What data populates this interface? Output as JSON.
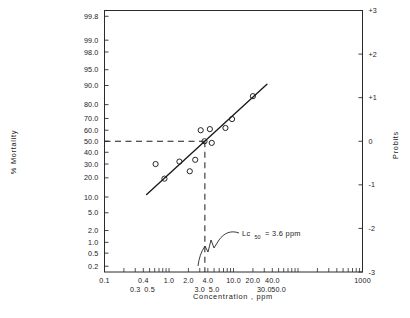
{
  "chart_data": {
    "type": "scatter",
    "title": "",
    "subtitle": "",
    "xlabel": "Concentration ,   ppm",
    "ylabel": "% Mortality",
    "y2label": "Probits",
    "x_scale": "log10",
    "y_scale": "probit",
    "xlim": [
      0.1,
      1000
    ],
    "ylim_percent": [
      0.13,
      99.87
    ],
    "ylim_probit": [
      -3,
      3
    ],
    "grid": false,
    "legend": null,
    "x_tick_labels": [
      "0.1",
      "0.3",
      "0.4",
      "0.5",
      "1.0",
      "2.0",
      "3.0",
      "4.0",
      "5.0",
      "10.0",
      "20.0",
      "30.0",
      "40.0",
      "50.0",
      "1000"
    ],
    "x_tick_values": [
      0.1,
      0.3,
      0.4,
      0.5,
      1.0,
      2.0,
      3.0,
      4.0,
      5.0,
      10.0,
      20.0,
      30.0,
      40.0,
      50.0,
      1000
    ],
    "x_tick_rows": [
      0,
      1,
      0,
      1,
      0,
      0,
      1,
      0,
      1,
      0,
      0,
      1,
      0,
      1,
      0
    ],
    "y_tick_labels": [
      "99.8",
      "99.0",
      "98.0",
      "95.0",
      "90.0",
      "80.0",
      "70.0",
      "60.0",
      "50.0",
      "40.0",
      "30.0",
      "20.0",
      "10.0",
      "5.0",
      "2.0",
      "1.0",
      "0.5",
      "0.2"
    ],
    "y_tick_values": [
      99.8,
      99.0,
      98.0,
      95.0,
      90.0,
      80.0,
      70.0,
      60.0,
      50.0,
      40.0,
      30.0,
      20.0,
      10.0,
      5.0,
      2.0,
      1.0,
      0.5,
      0.2
    ],
    "y2_tick_labels": [
      "+3",
      "+2",
      "+1",
      "0",
      "-1",
      "-2",
      "-3"
    ],
    "y2_tick_values": [
      3,
      2,
      1,
      0,
      -1,
      -2,
      -3
    ],
    "series": [
      {
        "name": "observed mortality",
        "marker": "open-circle",
        "points": [
          {
            "x": 0.62,
            "y_percent": 30.0
          },
          {
            "x": 0.85,
            "y_percent": 19.5
          },
          {
            "x": 1.45,
            "y_percent": 32.0
          },
          {
            "x": 2.1,
            "y_percent": 24.5
          },
          {
            "x": 2.55,
            "y_percent": 33.5
          },
          {
            "x": 3.1,
            "y_percent": 60.0
          },
          {
            "x": 3.55,
            "y_percent": 50.0
          },
          {
            "x": 4.3,
            "y_percent": 61.0
          },
          {
            "x": 4.6,
            "y_percent": 48.5
          },
          {
            "x": 7.5,
            "y_percent": 62.0
          },
          {
            "x": 9.5,
            "y_percent": 69.5
          },
          {
            "x": 20.0,
            "y_percent": 85.0
          }
        ]
      }
    ],
    "fit_line": {
      "name": "probit regression line",
      "x_start": 0.45,
      "y_percent_start": 11.0,
      "x_end": 33.0,
      "y_percent_end": 90.5
    },
    "reference_lines": [
      {
        "name": "lc50-horizontal",
        "orientation": "horizontal",
        "y_percent": 50.0,
        "style": "dashed"
      },
      {
        "name": "lc50-vertical",
        "orientation": "vertical",
        "x": 3.6,
        "style": "dashed"
      }
    ],
    "annotations": [
      {
        "name": "lc50-annotation",
        "text_main": "Lc",
        "text_sub": "50",
        "text_tail": "= 3.6 ppm",
        "points_to_x": 3.6,
        "points_to_y_percent": 0.2
      }
    ]
  },
  "axes": {
    "x_title": "Concentration ,   ppm",
    "y_title": "% Mortality",
    "y2_title": "Probits"
  }
}
